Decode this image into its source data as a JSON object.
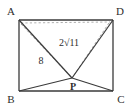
{
  "figure": {
    "type": "geometry-diagram",
    "background_color": "#ffffff",
    "line_color": "#3a3a3a",
    "dash_color": "#8a8a8a",
    "vertices": [
      {
        "name": "A",
        "label": "A",
        "x": 19,
        "y": 20,
        "label_x": 11,
        "label_y": 15
      },
      {
        "name": "D",
        "label": "D",
        "x": 113,
        "y": 20,
        "label_x": 117,
        "label_y": 15
      },
      {
        "name": "B",
        "label": "B",
        "x": 19,
        "y": 91,
        "label_x": 10,
        "label_y": 101
      },
      {
        "name": "C",
        "label": "C",
        "x": 113,
        "y": 91,
        "label_x": 118,
        "label_y": 101
      }
    ],
    "interior_point": {
      "name": "P",
      "label": "P",
      "x": 72,
      "y": 78,
      "label_x": 70,
      "label_y": 90
    },
    "rectangle_sides": [
      {
        "name": "side-AD",
        "from": "A",
        "to": "D"
      },
      {
        "name": "side-DC",
        "from": "D",
        "to": "C"
      },
      {
        "name": "side-CB",
        "from": "C",
        "to": "B"
      },
      {
        "name": "side-BA",
        "from": "B",
        "to": "A"
      }
    ],
    "solid_segments": [
      {
        "name": "segment-AP",
        "x1": 19,
        "y1": 20,
        "x2": 72,
        "y2": 78
      },
      {
        "name": "segment-DP",
        "x1": 113,
        "y1": 20,
        "x2": 72,
        "y2": 78
      },
      {
        "name": "segment-BP",
        "x1": 19,
        "y1": 91,
        "x2": 72,
        "y2": 78
      },
      {
        "name": "segment-CP",
        "x1": 113,
        "y1": 91,
        "x2": 72,
        "y2": 78
      }
    ],
    "dashed_segments": [
      {
        "name": "dashed-AP",
        "x1": 21,
        "y1": 24,
        "x2": 72,
        "y2": 78
      },
      {
        "name": "dashed-DP",
        "x1": 109,
        "y1": 23,
        "x2": 72,
        "y2": 78
      },
      {
        "name": "dashed-AD-upper",
        "x1": 21,
        "y1": 23,
        "x2": 110,
        "y2": 22
      }
    ],
    "measure_labels": [
      {
        "name": "length-label-8",
        "text": "8",
        "value": 8,
        "applies_to": "segment-AP",
        "x": 40,
        "y": 62
      },
      {
        "name": "length-label-2sqrt11",
        "text": "2√11",
        "value": "2√11",
        "applies_to": "segment-DP",
        "x": 68,
        "y": 45
      }
    ]
  }
}
